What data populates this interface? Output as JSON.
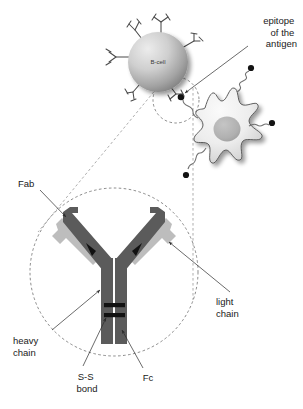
{
  "figure": {
    "background": "#ffffff",
    "width": 303,
    "height": 409
  },
  "colors": {
    "heavy_chain": "#5b5b5b",
    "light_chain": "#bdbdbd",
    "hinge_mark": "#111111",
    "ss_bond": "#111111",
    "b_cell_fill_light": "#e8e8e8",
    "b_cell_fill_dark": "#8d8d8d",
    "apc_fill_light": "#f4f4f4",
    "apc_fill_dark": "#cfcfcf",
    "apc_nucleus": "#b2b2b2",
    "dashed_stroke": "#5a5a5a",
    "leader_stroke": "#2b2b2b",
    "text": "#1a1a1a"
  },
  "labels": {
    "epitope": {
      "lines": [
        "epitope",
        "of the",
        "antigen"
      ],
      "align": "end"
    },
    "fab": "Fab",
    "light_chain": {
      "lines": [
        "light",
        "chain"
      ]
    },
    "heavy_chain": {
      "lines": [
        "heavy",
        "chain"
      ]
    },
    "ss_bond": {
      "lines": [
        "S-S",
        "bond"
      ]
    },
    "fc": "Fc"
  },
  "cells": {
    "b_cell": {
      "label": "B-cell",
      "cx": 158,
      "cy": 62,
      "r": 30,
      "surface_antibody_count": 6
    },
    "antigen_presenting_cell": {
      "label": "",
      "cx": 237,
      "cy": 130,
      "receptor_count": 4,
      "nucleus_cx": 227,
      "nucleus_cy": 129,
      "nucleus_r": 13
    }
  },
  "magnification": {
    "source_circle": {
      "cx": 176,
      "cy": 100,
      "r": 23
    },
    "target_circle": {
      "cx": 114,
      "cy": 272,
      "r": 84
    },
    "note": "dashed zoom callout from membrane-bound antibody to enlarged antibody"
  },
  "antibody": {
    "parts": [
      "heavy chain",
      "light chain",
      "Fab",
      "Fc",
      "S-S bond"
    ],
    "ss_bond_count": 2
  },
  "icons": {
    "epitope_arrow": "arrow-icon",
    "fab_arrow": "arrow-icon",
    "light_chain_arrow": "arrow-icon",
    "heavy_chain_arrow": "arrow-icon",
    "ss_bond_arrow": "arrow-icon",
    "fc_arrow": "arrow-icon"
  }
}
